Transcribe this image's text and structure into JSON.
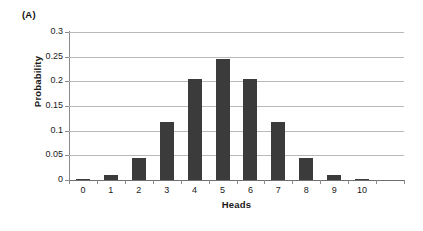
{
  "panel": {
    "label": "(A)"
  },
  "chart_data": {
    "type": "bar",
    "title": "",
    "subtitle": "",
    "xlabel": "Heads",
    "ylabel": "Probability",
    "categories": [
      "0",
      "1",
      "2",
      "3",
      "4",
      "5",
      "6",
      "7",
      "8",
      "9",
      "10",
      ""
    ],
    "values": [
      0.001,
      0.0098,
      0.0439,
      0.1172,
      0.2051,
      0.2461,
      0.2051,
      0.1172,
      0.0439,
      0.0098,
      0.001,
      0
    ],
    "series": [
      {
        "name": "Probability",
        "values": [
          0.001,
          0.0098,
          0.0439,
          0.1172,
          0.2051,
          0.2461,
          0.2051,
          0.1172,
          0.0439,
          0.0098,
          0.001,
          0
        ]
      }
    ],
    "ylim": [
      0,
      0.3
    ],
    "yticks": [
      0,
      0.05,
      0.1,
      0.15,
      0.2,
      0.25,
      0.3
    ],
    "ytick_labels": [
      "0",
      "0.05",
      "0.1",
      "0.15",
      "0.2",
      "0.25",
      "0.3"
    ],
    "xtick_labels": [
      "0",
      "1",
      "2",
      "3",
      "4",
      "5",
      "6",
      "7",
      "8",
      "9",
      "10"
    ],
    "grid": true,
    "grid_axis": "y",
    "legend": false,
    "legend_position": "none",
    "bar_color": "#3b3b3b",
    "gridline_color": "#b9b9b9",
    "axis_color": "#8a8a8a",
    "background_color": "#ffffff"
  }
}
